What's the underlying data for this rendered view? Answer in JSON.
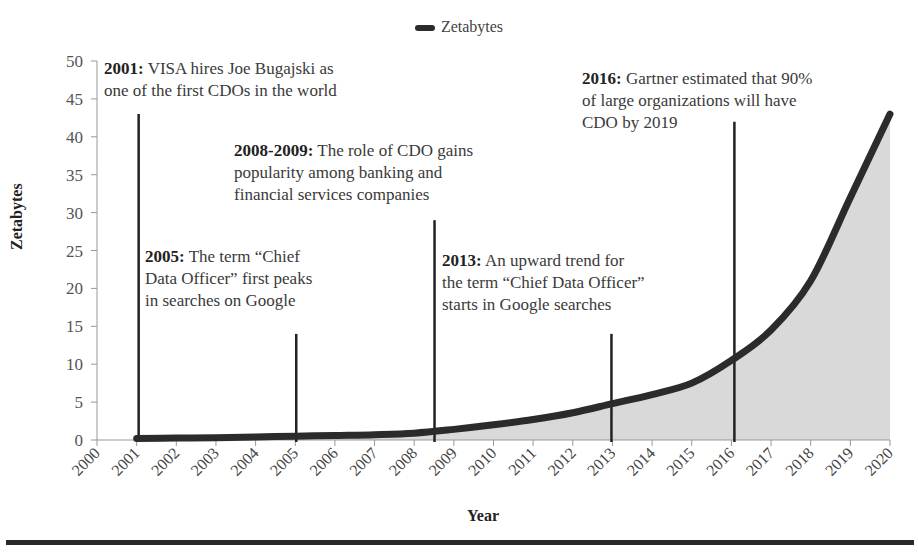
{
  "chart_data": {
    "type": "area",
    "title": "",
    "xlabel": "Year",
    "ylabel": "Zetabytes",
    "ylim": [
      0,
      50
    ],
    "yticks": [
      0,
      5,
      10,
      15,
      20,
      25,
      30,
      35,
      40,
      45,
      50
    ],
    "categories": [
      "2000",
      "2001",
      "2002",
      "2003",
      "2004",
      "2005",
      "2006",
      "2007",
      "2008",
      "2009",
      "2010",
      "2011",
      "2012",
      "2013",
      "2014",
      "2015",
      "2016",
      "2017",
      "2018",
      "2019",
      "2020"
    ],
    "series": [
      {
        "name": "Zetabytes",
        "values": [
          null,
          0.2,
          0.25,
          0.3,
          0.4,
          0.5,
          0.6,
          0.7,
          0.9,
          1.4,
          2.0,
          2.7,
          3.6,
          4.8,
          6.0,
          7.5,
          10.5,
          14.5,
          21.0,
          32.0,
          43.0
        ]
      }
    ],
    "legend": {
      "position": "top",
      "entries": [
        "Zetabytes"
      ]
    },
    "grid": false,
    "colors": {
      "line": "#2b2b2b",
      "fill": "#d9d9d9",
      "axis": "#999999",
      "marker_line": "#222222"
    },
    "annotations": [
      {
        "year": "2001",
        "bold": "2001:",
        "text": " VISA hires Joe Bugajski as one of the first CDOs in the world",
        "lines": [
          "VISA hires Joe Bugajski as",
          "one of the first CDOs in the world"
        ],
        "line_top_value": 43
      },
      {
        "year": "2005",
        "bold": "2005:",
        "text": " The term “Chief Data Officer” first peaks in searches on Google",
        "lines": [
          "The term “Chief",
          "Data Officer” first peaks",
          "in searches  on Google"
        ],
        "line_top_value": 14
      },
      {
        "year": "2008-2009",
        "bold": "2008-2009:",
        "text": " The role of CDO gains popularity among banking and financial services companies",
        "lines": [
          "The role of CDO gains",
          "popularity among banking and",
          "financial services companies"
        ],
        "line_top_value": 29
      },
      {
        "year": "2013",
        "bold": "2013:",
        "text": " An upward trend for the term “Chief Data Officer” starts in Google searches",
        "lines": [
          "An upward trend for",
          "the term “Chief Data Officer”",
          "starts in Google searches"
        ],
        "line_top_value": 14
      },
      {
        "year": "2016",
        "bold": "2016:",
        "text": " Gartner estimated that 90% of large organizations will have CDO by 2019",
        "lines": [
          "Gartner estimated that 90%",
          "of large organizations will have",
          "CDO by 2019"
        ],
        "line_top_value": 42
      }
    ]
  }
}
